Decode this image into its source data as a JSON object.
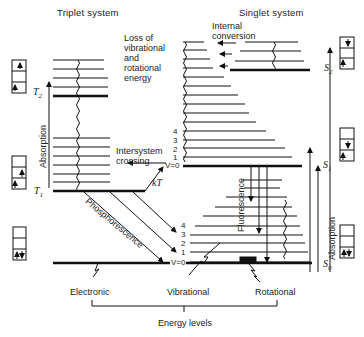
{
  "diagram": {
    "type": "jablonski-energy-level-diagram",
    "titles": {
      "triplet": "Triplet system",
      "singlet": "Singlet system"
    },
    "annotations": {
      "loss_line1": "Loss of",
      "loss_line2": "vibrational",
      "loss_line3": "and",
      "loss_line4": "rotational",
      "loss_line5": "energy",
      "internal_line1": "Internal",
      "internal_line2": "conversion",
      "isc_line1": "Intersystem",
      "isc_line2": "crossing",
      "kT": "kT",
      "phosphorescence": "Phosphorescence",
      "fluorescence": "Fluorescence",
      "absorption_triplet": "Absorption",
      "absorption_singlet": "Absorption"
    },
    "states": {
      "T1": "T",
      "T1_sub": "1",
      "T2": "T",
      "T2_sub": "2",
      "S0": "S",
      "S0_sub": "0",
      "S1": "S",
      "S1_sub": "1",
      "S2": "S",
      "S2_sub": "2"
    },
    "vibrational_labels_S1": [
      "4",
      "3",
      "2",
      "1",
      "V=0"
    ],
    "vibrational_labels_S0": [
      "4",
      "3",
      "2",
      "1",
      "V=0"
    ],
    "bottom_labels": {
      "electronic": "Electronic",
      "vibrational": "Vibrational",
      "rotational": "Rotational",
      "energy_levels": "Energy levels"
    },
    "spin_boxes": [
      {
        "state": "T2",
        "electrons": [
          "up (top)",
          "up (bottom)"
        ]
      },
      {
        "state": "T1",
        "electrons": [
          "up (middle)",
          "up (bottom)"
        ]
      },
      {
        "state": "S0 (triplet side)",
        "electrons": [
          "up-down (bottom)"
        ]
      },
      {
        "state": "S2",
        "electrons": [
          "down (top)",
          "up (bottom)"
        ]
      },
      {
        "state": "S1",
        "electrons": [
          "down (middle)",
          "up (bottom)"
        ]
      },
      {
        "state": "S0",
        "electrons": [
          "up-down (bottom)"
        ]
      }
    ]
  }
}
